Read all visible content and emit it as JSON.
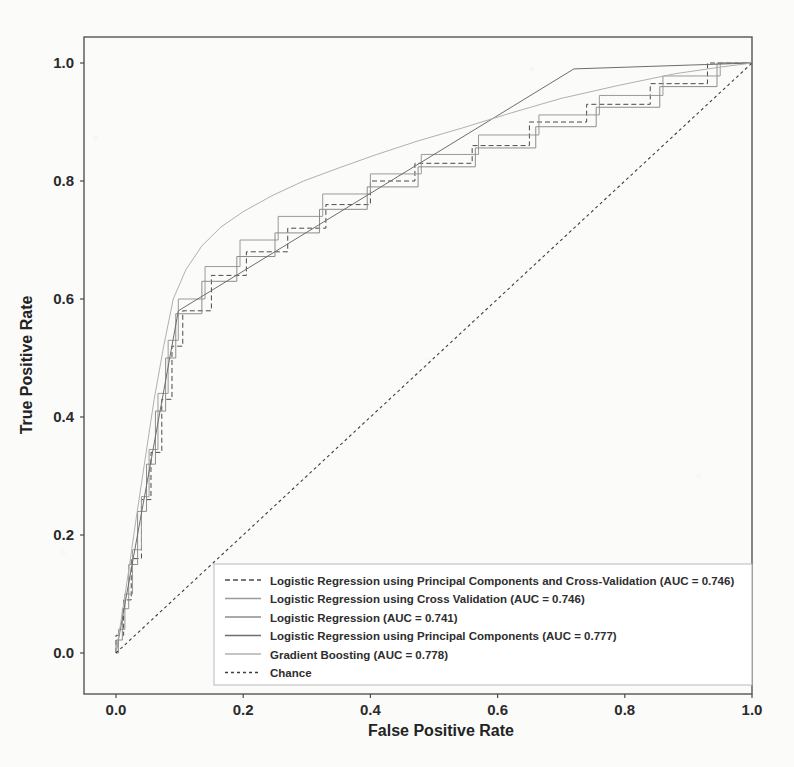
{
  "figure": {
    "background_color": "#fbfbfa",
    "frame_color": "#555555",
    "text_color": "#2b2b2b"
  },
  "axes": {
    "xlabel": "False Positive Rate",
    "ylabel": "True Positive Rate",
    "xticks": [
      "0.0",
      "0.2",
      "0.4",
      "0.6",
      "0.8",
      "1.0"
    ],
    "yticks": [
      "0.0",
      "0.2",
      "0.4",
      "0.6",
      "0.8",
      "1.0"
    ]
  },
  "legend": {
    "items": [
      {
        "label": "Logistic Regression using Principal Components and Cross-Validation (AUC = 0.746)",
        "dash": "5,3",
        "color": "#4a4a4a"
      },
      {
        "label": "Logistic Regression using Cross Validation (AUC = 0.746)",
        "dash": "none",
        "color": "#9a9a9a"
      },
      {
        "label": "Logistic Regression (AUC = 0.741)",
        "dash": "none",
        "color": "#8d8d8d"
      },
      {
        "label": "Logistic Regression using Principal Components (AUC = 0.777)",
        "dash": "none",
        "color": "#6e6e6e"
      },
      {
        "label": "Gradient Boosting (AUC = 0.778)",
        "dash": "none",
        "color": "#b0b0b0"
      },
      {
        "label": "Chance",
        "dash": "3,3",
        "color": "#3d3d3d"
      }
    ]
  },
  "chart_data": {
    "type": "line",
    "title": "",
    "xlabel": "False Positive Rate",
    "ylabel": "True Positive Rate",
    "xlim": [
      0.0,
      1.0
    ],
    "ylim": [
      0.0,
      1.0
    ],
    "grid": false,
    "legend_position": "lower right",
    "series": [
      {
        "name": "Logistic Regression using Principal Components and Cross-Validation",
        "auc": 0.746,
        "color": "#4a4a4a",
        "dash": "5,3",
        "points": [
          [
            0.0,
            0.0
          ],
          [
            0.0,
            0.03
          ],
          [
            0.012,
            0.03
          ],
          [
            0.012,
            0.09
          ],
          [
            0.024,
            0.09
          ],
          [
            0.024,
            0.16
          ],
          [
            0.04,
            0.16
          ],
          [
            0.04,
            0.26
          ],
          [
            0.055,
            0.26
          ],
          [
            0.055,
            0.34
          ],
          [
            0.072,
            0.34
          ],
          [
            0.072,
            0.43
          ],
          [
            0.088,
            0.43
          ],
          [
            0.088,
            0.52
          ],
          [
            0.105,
            0.52
          ],
          [
            0.105,
            0.58
          ],
          [
            0.15,
            0.58
          ],
          [
            0.15,
            0.64
          ],
          [
            0.205,
            0.64
          ],
          [
            0.205,
            0.68
          ],
          [
            0.27,
            0.68
          ],
          [
            0.27,
            0.72
          ],
          [
            0.33,
            0.72
          ],
          [
            0.33,
            0.76
          ],
          [
            0.4,
            0.76
          ],
          [
            0.4,
            0.8
          ],
          [
            0.47,
            0.8
          ],
          [
            0.47,
            0.83
          ],
          [
            0.56,
            0.83
          ],
          [
            0.56,
            0.86
          ],
          [
            0.65,
            0.86
          ],
          [
            0.65,
            0.9
          ],
          [
            0.74,
            0.9
          ],
          [
            0.74,
            0.93
          ],
          [
            0.84,
            0.93
          ],
          [
            0.84,
            0.965
          ],
          [
            0.93,
            0.965
          ],
          [
            0.93,
            1.0
          ],
          [
            1.0,
            1.0
          ]
        ]
      },
      {
        "name": "Logistic Regression using Cross Validation",
        "auc": 0.746,
        "color": "#9a9a9a",
        "dash": "none",
        "points": [
          [
            0.0,
            0.0
          ],
          [
            0.004,
            0.0
          ],
          [
            0.004,
            0.04
          ],
          [
            0.014,
            0.04
          ],
          [
            0.014,
            0.1
          ],
          [
            0.026,
            0.1
          ],
          [
            0.026,
            0.175
          ],
          [
            0.04,
            0.175
          ],
          [
            0.04,
            0.265
          ],
          [
            0.052,
            0.265
          ],
          [
            0.052,
            0.345
          ],
          [
            0.066,
            0.345
          ],
          [
            0.066,
            0.44
          ],
          [
            0.082,
            0.44
          ],
          [
            0.082,
            0.53
          ],
          [
            0.098,
            0.53
          ],
          [
            0.098,
            0.6
          ],
          [
            0.14,
            0.6
          ],
          [
            0.14,
            0.655
          ],
          [
            0.195,
            0.655
          ],
          [
            0.195,
            0.7
          ],
          [
            0.255,
            0.7
          ],
          [
            0.255,
            0.74
          ],
          [
            0.325,
            0.74
          ],
          [
            0.325,
            0.778
          ],
          [
            0.4,
            0.778
          ],
          [
            0.4,
            0.812
          ],
          [
            0.48,
            0.812
          ],
          [
            0.48,
            0.845
          ],
          [
            0.57,
            0.845
          ],
          [
            0.57,
            0.878
          ],
          [
            0.665,
            0.878
          ],
          [
            0.665,
            0.912
          ],
          [
            0.76,
            0.912
          ],
          [
            0.76,
            0.945
          ],
          [
            0.86,
            0.945
          ],
          [
            0.86,
            0.978
          ],
          [
            0.95,
            0.978
          ],
          [
            0.95,
            1.0
          ],
          [
            1.0,
            1.0
          ]
        ]
      },
      {
        "name": "Logistic Regression",
        "auc": 0.741,
        "color": "#8d8d8d",
        "dash": "none",
        "points": [
          [
            0.0,
            0.0
          ],
          [
            0.0,
            0.022
          ],
          [
            0.01,
            0.022
          ],
          [
            0.01,
            0.075
          ],
          [
            0.02,
            0.075
          ],
          [
            0.02,
            0.15
          ],
          [
            0.034,
            0.15
          ],
          [
            0.034,
            0.24
          ],
          [
            0.048,
            0.24
          ],
          [
            0.048,
            0.32
          ],
          [
            0.062,
            0.32
          ],
          [
            0.062,
            0.41
          ],
          [
            0.078,
            0.41
          ],
          [
            0.078,
            0.5
          ],
          [
            0.094,
            0.5
          ],
          [
            0.094,
            0.575
          ],
          [
            0.135,
            0.575
          ],
          [
            0.135,
            0.63
          ],
          [
            0.19,
            0.63
          ],
          [
            0.19,
            0.672
          ],
          [
            0.25,
            0.672
          ],
          [
            0.25,
            0.712
          ],
          [
            0.32,
            0.712
          ],
          [
            0.32,
            0.752
          ],
          [
            0.395,
            0.752
          ],
          [
            0.395,
            0.79
          ],
          [
            0.475,
            0.79
          ],
          [
            0.475,
            0.824
          ],
          [
            0.565,
            0.824
          ],
          [
            0.565,
            0.856
          ],
          [
            0.66,
            0.856
          ],
          [
            0.66,
            0.892
          ],
          [
            0.755,
            0.892
          ],
          [
            0.755,
            0.925
          ],
          [
            0.855,
            0.925
          ],
          [
            0.855,
            0.96
          ],
          [
            0.945,
            0.96
          ],
          [
            0.945,
            1.0
          ],
          [
            1.0,
            1.0
          ]
        ]
      },
      {
        "name": "Logistic Regression using Principal Components",
        "auc": 0.777,
        "color": "#6e6e6e",
        "dash": "none",
        "points": [
          [
            0.0,
            0.0
          ],
          [
            0.098,
            0.58
          ],
          [
            0.72,
            0.99
          ],
          [
            1.0,
            1.0
          ]
        ]
      },
      {
        "name": "Gradient Boosting",
        "auc": 0.778,
        "color": "#b0b0b0",
        "dash": "none",
        "points": [
          [
            0.0,
            0.0
          ],
          [
            0.008,
            0.055
          ],
          [
            0.02,
            0.14
          ],
          [
            0.032,
            0.23
          ],
          [
            0.046,
            0.33
          ],
          [
            0.06,
            0.43
          ],
          [
            0.075,
            0.52
          ],
          [
            0.09,
            0.6
          ],
          [
            0.11,
            0.65
          ],
          [
            0.135,
            0.69
          ],
          [
            0.165,
            0.722
          ],
          [
            0.2,
            0.748
          ],
          [
            0.245,
            0.775
          ],
          [
            0.295,
            0.8
          ],
          [
            0.35,
            0.822
          ],
          [
            0.41,
            0.845
          ],
          [
            0.475,
            0.868
          ],
          [
            0.545,
            0.89
          ],
          [
            0.62,
            0.915
          ],
          [
            0.7,
            0.94
          ],
          [
            0.79,
            0.962
          ],
          [
            0.88,
            0.982
          ],
          [
            0.95,
            0.993
          ],
          [
            1.0,
            1.0
          ]
        ]
      },
      {
        "name": "Chance",
        "auc": 0.5,
        "color": "#3d3d3d",
        "dash": "3,3",
        "points": [
          [
            0.0,
            0.0
          ],
          [
            1.0,
            1.0
          ]
        ]
      }
    ]
  }
}
